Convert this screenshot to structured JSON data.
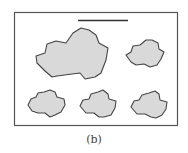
{
  "figure": {
    "caption": "(b)",
    "colors": {
      "frame": "#555555",
      "bar": "#333333",
      "shape_fill": "#d9d9d9",
      "shape_stroke": "#444444"
    },
    "shapes": [
      {
        "name": "large-blob",
        "size": "large"
      },
      {
        "name": "small-blob-top-right",
        "size": "small"
      },
      {
        "name": "small-blob-bottom-left",
        "size": "small"
      },
      {
        "name": "small-blob-bottom-middle",
        "size": "small"
      },
      {
        "name": "small-blob-bottom-right",
        "size": "small"
      }
    ]
  }
}
